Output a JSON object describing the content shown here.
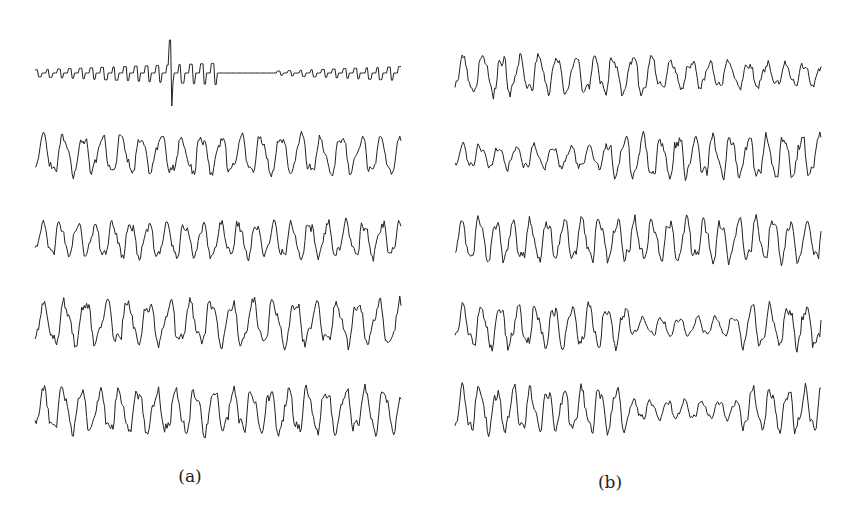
{
  "figure": {
    "panels": [
      {
        "id": "a",
        "label": "(a)",
        "label_pos": {
          "x": 190,
          "y": 466
        },
        "x_start": 35,
        "x_end": 402,
        "traces": [
          {
            "center_y": 73,
            "amplitude": 10,
            "style": "sparse-spiky",
            "seed": 11,
            "spike_at": 0.37,
            "spike_height": 33
          },
          {
            "center_y": 155,
            "amplitude": 22,
            "style": "dense",
            "seed": 23,
            "freq": 0.38
          },
          {
            "center_y": 240,
            "amplitude": 20,
            "style": "dense",
            "seed": 37,
            "freq": 0.42
          },
          {
            "center_y": 323,
            "amplitude": 25,
            "style": "dense",
            "seed": 41,
            "freq": 0.36
          },
          {
            "center_y": 411,
            "amplitude": 25,
            "style": "dense",
            "seed": 53,
            "freq": 0.4
          }
        ]
      },
      {
        "id": "b",
        "label": "(b)",
        "label_pos": {
          "x": 610,
          "y": 472
        },
        "x_start": 455,
        "x_end": 822,
        "traces": [
          {
            "center_y": 75,
            "amplitude": 22,
            "style": "decay",
            "seed": 67,
            "freq": 0.4
          },
          {
            "center_y": 157,
            "amplitude": 24,
            "style": "grow",
            "seed": 71,
            "freq": 0.42
          },
          {
            "center_y": 240,
            "amplitude": 24,
            "style": "dense",
            "seed": 83,
            "freq": 0.44
          },
          {
            "center_y": 326,
            "amplitude": 24,
            "style": "dip-middle",
            "seed": 97,
            "freq": 0.42
          },
          {
            "center_y": 410,
            "amplitude": 25,
            "style": "dip-middle",
            "seed": 101,
            "freq": 0.44
          }
        ]
      }
    ],
    "stroke_color": "#222222",
    "background": "#ffffff"
  }
}
